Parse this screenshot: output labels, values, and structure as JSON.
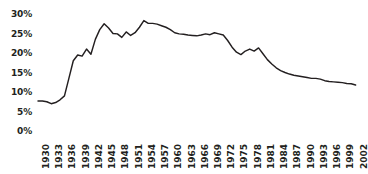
{
  "chart_data": {
    "type": "line",
    "title": "",
    "subtitle": "",
    "xlabel": "",
    "ylabel": "",
    "xlim": [
      1930,
      2003
    ],
    "ylim": [
      0,
      30
    ],
    "grid": false,
    "legend": null,
    "annotations": [],
    "series_color": "#231f20",
    "y_ticks": [
      "30%",
      "25%",
      "20%",
      "15%",
      "10%",
      "5%",
      "0%"
    ],
    "y_tick_values": [
      30,
      25,
      20,
      15,
      10,
      5,
      0
    ],
    "x_ticks": [
      "1930",
      "1933",
      "1936",
      "1939",
      "1942",
      "1945",
      "1948",
      "1951",
      "1954",
      "1957",
      "1960",
      "1963",
      "1966",
      "1969",
      "1972",
      "1975",
      "1978",
      "1981",
      "1984",
      "1987",
      "1990",
      "1993",
      "1996",
      "1999",
      "2002"
    ],
    "x_tick_values": [
      1930,
      1933,
      1936,
      1939,
      1942,
      1945,
      1948,
      1951,
      1954,
      1957,
      1960,
      1963,
      1966,
      1969,
      1972,
      1975,
      1978,
      1981,
      1984,
      1987,
      1990,
      1993,
      1996,
      1999,
      2002
    ],
    "series": [
      {
        "name": "percent",
        "x": [
          1930,
          1931,
          1932,
          1933,
          1934,
          1935,
          1936,
          1937,
          1938,
          1939,
          1940,
          1941,
          1942,
          1943,
          1944,
          1945,
          1946,
          1947,
          1948,
          1949,
          1950,
          1951,
          1952,
          1953,
          1954,
          1955,
          1956,
          1957,
          1958,
          1959,
          1960,
          1961,
          1962,
          1963,
          1964,
          1965,
          1966,
          1967,
          1968,
          1969,
          1970,
          1971,
          1972,
          1973,
          1974,
          1975,
          1976,
          1977,
          1978,
          1979,
          1980,
          1981,
          1982,
          1983,
          1984,
          1985,
          1986,
          1987,
          1988,
          1989,
          1990,
          1991,
          1992,
          1993,
          1994,
          1995,
          1996,
          1997,
          1998,
          1999,
          2000,
          2001,
          2002
        ],
        "values": [
          7.7,
          7.7,
          7.5,
          7.0,
          7.3,
          8.0,
          9.0,
          13.5,
          18.0,
          19.5,
          19.2,
          21.0,
          19.7,
          23.5,
          26.0,
          27.5,
          26.4,
          25.0,
          24.9,
          24.0,
          25.4,
          24.5,
          25.2,
          26.6,
          28.3,
          27.6,
          27.6,
          27.4,
          27.0,
          26.6,
          26.0,
          25.2,
          24.9,
          24.8,
          24.6,
          24.5,
          24.4,
          24.6,
          24.9,
          24.7,
          25.2,
          24.9,
          24.6,
          23.2,
          21.5,
          20.2,
          19.6,
          20.5,
          21.0,
          20.5,
          21.3,
          19.8,
          18.3,
          17.2,
          16.2,
          15.5,
          15.0,
          14.6,
          14.3,
          14.1,
          13.9,
          13.7,
          13.5,
          13.5,
          13.3,
          12.9,
          12.7,
          12.6,
          12.5,
          12.4,
          12.2,
          12.1,
          11.8
        ]
      }
    ]
  },
  "geometry": {
    "plot_left": 38,
    "plot_right": 360,
    "plot_top": 14,
    "plot_bottom": 131,
    "x_label_top": 139,
    "y_label_right": 32
  }
}
